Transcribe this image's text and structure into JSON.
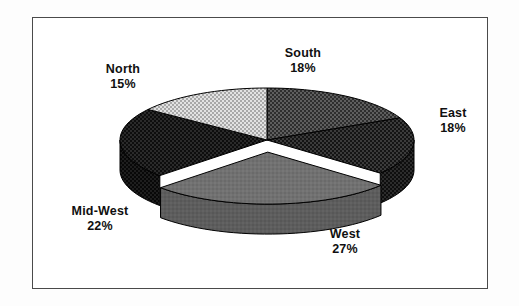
{
  "figure": {
    "background_color": "#ffffff",
    "frame_color": "#4a4a4a",
    "title": ""
  },
  "chart_data": {
    "type": "pie",
    "title": "",
    "subtitle": "",
    "xlabel": "",
    "ylabel": "",
    "three_d": true,
    "legend_position": "none",
    "labels_position": "outside",
    "total_percent": 100,
    "categories": [
      "South",
      "East",
      "West",
      "Mid-West",
      "North"
    ],
    "values": [
      18,
      18,
      27,
      22,
      15
    ],
    "value_unit": "%",
    "slices": [
      {
        "label": "South",
        "value": 18,
        "value_text": "18%",
        "fill_color": "#3d3d3d",
        "side_color": "#2a2a2a",
        "pattern": "dark-checker",
        "exploded": false,
        "start_angle_deg": 0,
        "end_angle_deg": 64.8
      },
      {
        "label": "East",
        "value": 18,
        "value_text": "18%",
        "fill_color": "#1c1c1c",
        "side_color": "#131313",
        "pattern": "dense-dot",
        "exploded": false,
        "start_angle_deg": 64.8,
        "end_angle_deg": 129.6
      },
      {
        "label": "West",
        "value": 27,
        "value_text": "27%",
        "fill_color": "#6f6f6f",
        "side_color": "#585858",
        "pattern": "solid-gray",
        "exploded": true,
        "start_angle_deg": 129.6,
        "end_angle_deg": 226.8
      },
      {
        "label": "Mid-West",
        "value": 22,
        "value_text": "22%",
        "fill_color": "#171717",
        "side_color": "#101010",
        "pattern": "black-weave",
        "exploded": false,
        "start_angle_deg": 226.8,
        "end_angle_deg": 306.0
      },
      {
        "label": "North",
        "value": 15,
        "value_text": "15%",
        "fill_color": "#c9c9c9",
        "side_color": "#a5a5a5",
        "pattern": "light-dot",
        "exploded": false,
        "start_angle_deg": 306.0,
        "end_angle_deg": 360.0
      }
    ]
  },
  "labels": {
    "north": {
      "name": "North",
      "value": "15%"
    },
    "south": {
      "name": "South",
      "value": "18%"
    },
    "east": {
      "name": "East",
      "value": "18%"
    },
    "west": {
      "name": "West",
      "value": "27%"
    },
    "midwest": {
      "name": "Mid-West",
      "value": "22%"
    }
  }
}
